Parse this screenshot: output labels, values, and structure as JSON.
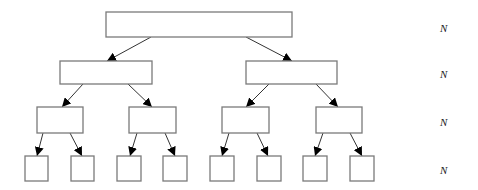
{
  "diagram": {
    "type": "binary-tree",
    "levels": [
      {
        "label": "N",
        "label_y": 28,
        "nodes": [
          {
            "x": 106,
            "y": 12,
            "w": 186,
            "h": 25
          }
        ]
      },
      {
        "label": "N",
        "label_y": 74,
        "nodes": [
          {
            "x": 60,
            "y": 61,
            "w": 92,
            "h": 23
          },
          {
            "x": 246,
            "y": 61,
            "w": 91,
            "h": 23
          }
        ]
      },
      {
        "label": "N",
        "label_y": 122,
        "nodes": [
          {
            "x": 37,
            "y": 107,
            "w": 46,
            "h": 26
          },
          {
            "x": 129,
            "y": 107,
            "w": 47,
            "h": 26
          },
          {
            "x": 222,
            "y": 107,
            "w": 47,
            "h": 26
          },
          {
            "x": 316,
            "y": 107,
            "w": 46,
            "h": 26
          }
        ]
      },
      {
        "label": "N",
        "label_y": 170,
        "nodes": [
          {
            "x": 25,
            "y": 156,
            "w": 23,
            "h": 25
          },
          {
            "x": 71,
            "y": 156,
            "w": 23,
            "h": 25
          },
          {
            "x": 117,
            "y": 156,
            "w": 24,
            "h": 25
          },
          {
            "x": 163,
            "y": 156,
            "w": 24,
            "h": 25
          },
          {
            "x": 210,
            "y": 156,
            "w": 24,
            "h": 25
          },
          {
            "x": 257,
            "y": 156,
            "w": 24,
            "h": 25
          },
          {
            "x": 303,
            "y": 156,
            "w": 24,
            "h": 25
          },
          {
            "x": 350,
            "y": 156,
            "w": 24,
            "h": 25
          }
        ]
      }
    ],
    "edges": [
      {
        "x1": 151,
        "y1": 37,
        "x2": 107,
        "y2": 61
      },
      {
        "x1": 246,
        "y1": 37,
        "x2": 292,
        "y2": 61
      },
      {
        "x1": 83,
        "y1": 84,
        "x2": 62,
        "y2": 107
      },
      {
        "x1": 128,
        "y1": 84,
        "x2": 152,
        "y2": 107
      },
      {
        "x1": 269,
        "y1": 84,
        "x2": 246,
        "y2": 107
      },
      {
        "x1": 316,
        "y1": 84,
        "x2": 338,
        "y2": 107
      },
      {
        "x1": 43,
        "y1": 133,
        "x2": 37,
        "y2": 156
      },
      {
        "x1": 70,
        "y1": 133,
        "x2": 82,
        "y2": 156
      },
      {
        "x1": 137,
        "y1": 133,
        "x2": 130,
        "y2": 156
      },
      {
        "x1": 165,
        "y1": 133,
        "x2": 175,
        "y2": 156
      },
      {
        "x1": 229,
        "y1": 133,
        "x2": 222,
        "y2": 156
      },
      {
        "x1": 257,
        "y1": 133,
        "x2": 268,
        "y2": 156
      },
      {
        "x1": 323,
        "y1": 133,
        "x2": 315,
        "y2": 156
      },
      {
        "x1": 350,
        "y1": 133,
        "x2": 362,
        "y2": 156
      }
    ],
    "colors": {
      "node_border": "#7a7a7a",
      "edge": "#333333",
      "arrowhead": "#000000"
    }
  }
}
